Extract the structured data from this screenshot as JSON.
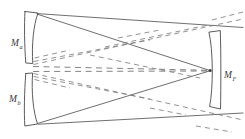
{
  "diagram": {
    "type": "optical-ray-diagram",
    "colors": {
      "background": "#ffffff",
      "mirror_outline": "#4a4a4a",
      "solid_ray": "#555555",
      "dashed_ray": "#6d6d6d",
      "label_text": "#3a3a3a"
    },
    "labels": {
      "mirror_a": {
        "base": "M",
        "subscript": "a",
        "full": "M_a"
      },
      "mirror_b": {
        "base": "M",
        "subscript": "b",
        "full": "M_b"
      },
      "mirror_f": {
        "base": "M",
        "subscript": "F",
        "full": "M_F"
      }
    },
    "elements": {
      "mirror_a_name": "upper-left concave mirror",
      "mirror_b_name": "lower-left concave mirror",
      "mirror_f_name": "right concave mirror",
      "solid_rays_name": "solid ray paths",
      "dashed_rays_name": "dashed ray paths",
      "focus_name": "convergence point at right mirror"
    }
  }
}
